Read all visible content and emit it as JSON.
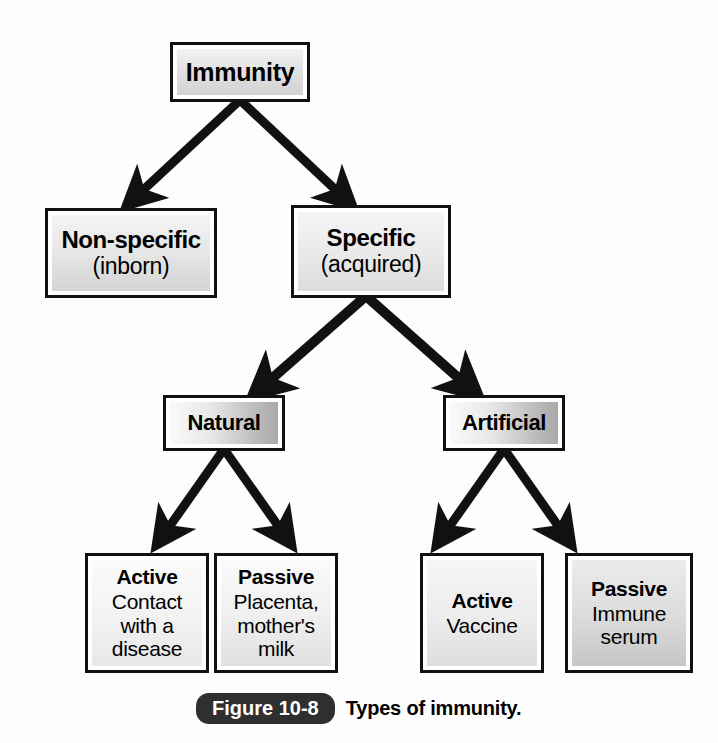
{
  "figure": {
    "caption_label": "Figure 10-8",
    "caption_text": "Types of immunity.",
    "background_color": "#fdfdfd",
    "border_color": "#111111",
    "pill_color": "#2f2f2f"
  },
  "nodes": {
    "immunity": {
      "title": "Immunity",
      "sub": ""
    },
    "nonspecific": {
      "title": "Non-specific",
      "sub": "(inborn)"
    },
    "specific": {
      "title": "Specific",
      "sub": "(acquired)"
    },
    "natural": {
      "title": "Natural",
      "sub": ""
    },
    "artificial": {
      "title": "Artificial",
      "sub": ""
    },
    "natural_active": {
      "title": "Active",
      "sub": "Contact with a disease"
    },
    "natural_passive": {
      "title": "Passive",
      "sub": "Placenta, mother's milk"
    },
    "artificial_active": {
      "title": "Active",
      "sub": "Vaccine"
    },
    "artificial_passive": {
      "title": "Passive",
      "sub": "Immune serum"
    }
  },
  "connectors": [
    {
      "name": "immunity-to-nonspecific",
      "from": "immunity",
      "to": "nonspecific"
    },
    {
      "name": "immunity-to-specific",
      "from": "immunity",
      "to": "specific"
    },
    {
      "name": "specific-to-natural",
      "from": "specific",
      "to": "natural"
    },
    {
      "name": "specific-to-artificial",
      "from": "specific",
      "to": "artificial"
    },
    {
      "name": "natural-to-active",
      "from": "natural",
      "to": "natural_active"
    },
    {
      "name": "natural-to-passive",
      "from": "natural",
      "to": "natural_passive"
    },
    {
      "name": "artificial-to-active",
      "from": "artificial",
      "to": "artificial_active"
    },
    {
      "name": "artificial-to-passive",
      "from": "artificial",
      "to": "artificial_passive"
    }
  ]
}
